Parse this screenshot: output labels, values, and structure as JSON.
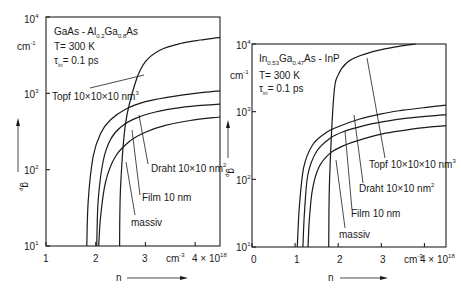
{
  "chart_data": [
    {
      "type": "line",
      "panel": "left",
      "title_lines": [
        "GaAs - Al0.2Ga0.8As",
        "T= 300 K",
        "τin= 0.1 ps"
      ],
      "xlabel": "n",
      "x_unit": "cm⁻³",
      "ylabel": "gp",
      "y_unit": "cm⁻¹",
      "xlim": [
        1,
        4.5
      ],
      "ylim": [
        10,
        10000
      ],
      "yscale": "log",
      "x_ticks": [
        "1",
        "2",
        "3",
        "4 × 10¹⁸"
      ],
      "y_ticks": [
        "10¹",
        "10²",
        "10³",
        "10⁴"
      ],
      "series": [
        {
          "name": "Topf 10×10×10 nm³",
          "x": [
            2.48,
            2.5,
            2.6,
            2.8,
            3.0,
            3.3,
            3.7,
            4.1,
            4.5
          ],
          "y": [
            10,
            60,
            400,
            1400,
            2600,
            3700,
            4500,
            5000,
            5400
          ]
        },
        {
          "name": "Draht 10×10 nm²",
          "x": [
            1.82,
            1.85,
            1.95,
            2.1,
            2.3,
            2.6,
            3.0,
            3.5,
            4.0,
            4.5
          ],
          "y": [
            10,
            40,
            150,
            300,
            450,
            620,
            780,
            900,
            1000,
            1080
          ]
        },
        {
          "name": "Film 10 nm",
          "x": [
            2.02,
            2.05,
            2.15,
            2.3,
            2.5,
            2.8,
            3.2,
            3.7,
            4.2,
            4.5
          ],
          "y": [
            10,
            40,
            130,
            250,
            360,
            470,
            570,
            650,
            700,
            720
          ]
        },
        {
          "name": "massiv",
          "x": [
            2.06,
            2.1,
            2.2,
            2.4,
            2.7,
            3.0,
            3.4,
            3.9,
            4.5
          ],
          "y": [
            10,
            25,
            70,
            150,
            240,
            310,
            380,
            440,
            490
          ]
        }
      ],
      "annotations": [
        "Topf 10×10×10 nm³",
        "Draht 10×10 nm²",
        "Film 10 nm",
        "massiv"
      ]
    },
    {
      "type": "line",
      "panel": "right",
      "title_lines": [
        "In0.53Ga0.47As - InP",
        "T= 300 K",
        "τin= 0.1 ps"
      ],
      "xlabel": "n",
      "x_unit": "cm⁻³",
      "ylabel": "gp",
      "y_unit": "cm⁻¹",
      "xlim": [
        0,
        4.5
      ],
      "ylim": [
        10,
        10000
      ],
      "yscale": "log",
      "x_ticks": [
        "0",
        "1",
        "2",
        "3",
        "4 × 10¹⁸"
      ],
      "y_ticks": [
        "10¹",
        "10²",
        "10³",
        "10⁴"
      ],
      "series": [
        {
          "name": "Topf 10×10×10 nm³",
          "x": [
            1.78,
            1.8,
            1.9,
            2.0,
            2.2,
            2.5,
            2.9,
            3.3,
            3.8
          ],
          "y": [
            10,
            100,
            1800,
            3500,
            5300,
            6700,
            8000,
            9000,
            10000
          ]
        },
        {
          "name": "Draht 10×10 nm²",
          "x": [
            1.05,
            1.1,
            1.2,
            1.4,
            1.7,
            2.0,
            2.5,
            3.0,
            3.5,
            4.0,
            4.5
          ],
          "y": [
            10,
            40,
            150,
            320,
            480,
            600,
            780,
            930,
            1050,
            1150,
            1250
          ]
        },
        {
          "name": "Film 10 nm",
          "x": [
            1.18,
            1.22,
            1.3,
            1.5,
            1.8,
            2.1,
            2.6,
            3.1,
            3.6,
            4.1,
            4.5
          ],
          "y": [
            10,
            35,
            120,
            260,
            400,
            500,
            620,
            720,
            800,
            860,
            900
          ]
        },
        {
          "name": "massiv",
          "x": [
            1.3,
            1.33,
            1.4,
            1.55,
            1.8,
            2.1,
            2.6,
            3.1,
            3.6,
            4.1,
            4.5
          ],
          "y": [
            10,
            25,
            70,
            150,
            240,
            310,
            400,
            480,
            540,
            590,
            620
          ]
        }
      ],
      "annotations": [
        "Topf 10×10×10 nm³",
        "Draht 10×10 nm²",
        "Film 10 nm",
        "massiv"
      ]
    }
  ],
  "labels": {
    "left": {
      "line1_main": "GaAs - Al",
      "line1_sub1": "0.2",
      "line1_mid": "Ga",
      "line1_sub2": "0.8",
      "line1_end": "As",
      "line2": "T= 300 K",
      "line3_tau": "τ",
      "line3_sub": "in",
      "line3_rest": "= 0.1 ps",
      "unit_y": "cm",
      "unit_y_exp": "-1",
      "ylabel": "g",
      "ylabel_sub": "p",
      "xlabel": "n",
      "unit_x": "cm",
      "unit_x_exp": "-3",
      "topf": "Topf  10×10×10 nm",
      "topf_exp": "3",
      "draht": "Draht  10×10 nm",
      "draht_exp": "2",
      "film": "Film  10 nm",
      "massiv": "massiv",
      "xt1": "1",
      "xt2": "2",
      "xt3": "3",
      "xt4": "4 × 10",
      "xt4_exp": "18",
      "yt1": "10",
      "yt1_exp": "1",
      "yt2": "10",
      "yt2_exp": "2",
      "yt3": "10",
      "yt3_exp": "3",
      "yt4": "10",
      "yt4_exp": "4"
    },
    "right": {
      "line1_a": "In",
      "line1_sub1": "0.53",
      "line1_b": "Ga",
      "line1_sub2": "0.47",
      "line1_c": "As - InP",
      "line2": "T= 300 K",
      "line3_tau": "τ",
      "line3_sub": "in",
      "line3_rest": "= 0.1 ps",
      "unit_y": "cm",
      "unit_y_exp": "-1",
      "ylabel": "g",
      "ylabel_sub": "p",
      "xlabel": "n",
      "unit_x": "cm",
      "unit_x_exp": "-3",
      "topf": "Topf  10×10×10 nm",
      "topf_exp": "3",
      "draht": "Draht  10×10 nm",
      "draht_exp": "2",
      "film": "Film  10 nm",
      "massiv": "massiv",
      "xt0": "0",
      "xt1": "1",
      "xt2": "2",
      "xt3": "3",
      "xt4": "4 × 10",
      "xt4_exp": "18",
      "yt1": "10",
      "yt1_exp": "1",
      "yt2": "10",
      "yt2_exp": "2",
      "yt3": "10",
      "yt3_exp": "3",
      "yt4": "10",
      "yt4_exp": "4"
    }
  }
}
